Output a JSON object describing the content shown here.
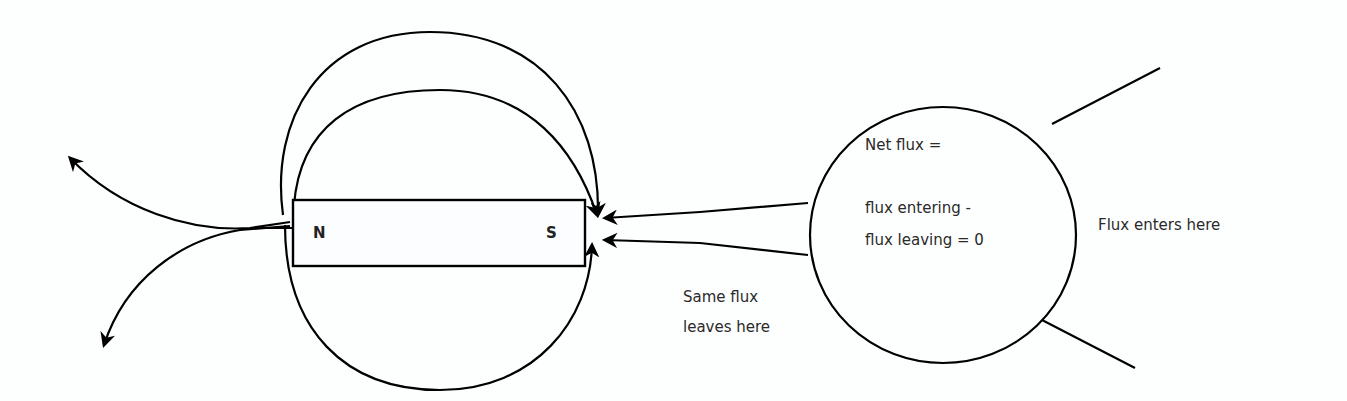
{
  "diagram": {
    "magnet": {
      "north_label": "N",
      "south_label": "S"
    },
    "surface": {
      "line1": "Net flux =",
      "line2": "flux entering -",
      "line3": "flux leaving = 0"
    },
    "annotations": {
      "enters": "Flux enters here",
      "leaves_line1": "Same flux",
      "leaves_line2": "leaves here"
    },
    "colors": {
      "stroke": "#000000",
      "text": "#2a2a2a",
      "background": "#fdfefe"
    }
  }
}
